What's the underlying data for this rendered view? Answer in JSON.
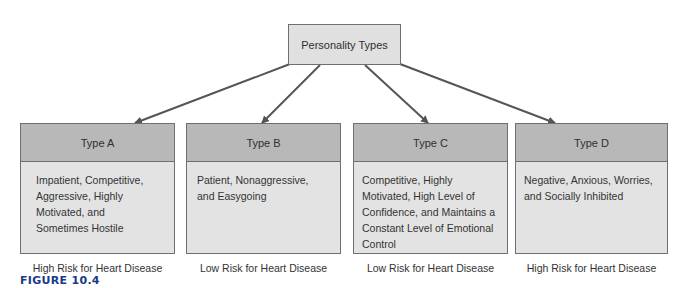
{
  "root": {
    "label": "Personality Types"
  },
  "types": [
    {
      "title": "Type A",
      "description": "Impatient, Competitive, Aggressive, Highly Motivated, and Sometimes Hostile",
      "risk": "High Risk for Heart Disease"
    },
    {
      "title": "Type B",
      "description": "Patient, Nonaggressive, and Easygoing",
      "risk": "Low Risk for Heart Disease"
    },
    {
      "title": "Type C",
      "description": "Competitive, Highly Motivated, High Level of Confidence, and Maintains a Constant Level of Emotional Control",
      "risk": "Low Risk for Heart Disease"
    },
    {
      "title": "Type D",
      "description": "Negative, Anxious, Worries, and Socially Inhibited",
      "risk": "High Risk for Heart Disease"
    }
  ],
  "caption": "FIGURE 10.4",
  "colors": {
    "header": "#b8b8b8",
    "body": "#e3e3e3",
    "arrow": "#555555",
    "caption": "#1a3a8a"
  }
}
